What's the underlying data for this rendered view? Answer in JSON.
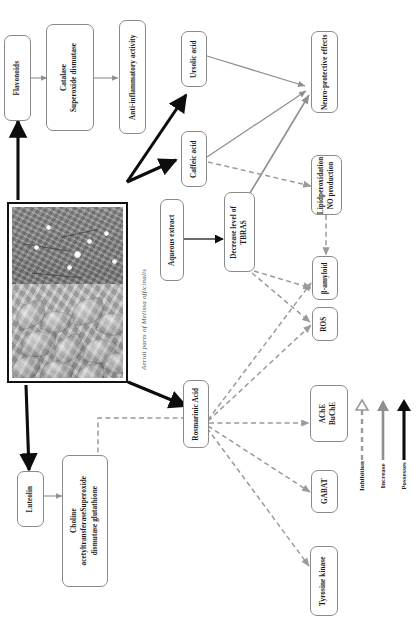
{
  "figure": {
    "caption": "Aerial parts of Melissa officinalis",
    "caption_species": "Melissa officinalis",
    "photo_alt": "Photograph of aerial parts of Melissa officinalis"
  },
  "nodes": {
    "flavonoids": "Flavonoids",
    "catalase_sod": "Catalase\nSuperoxide dismutase",
    "anti_inflammatory": "Anti-inflammatory activity",
    "ursolic_acid": "Ursolic acid",
    "caffeic_acid": "Caffeic acid",
    "neuroprotective": "Neuro-protective effects",
    "lipid_no": "Lipidperoxidation\nNO production",
    "aqueous_extract": "Aqueous extract",
    "tbras": "Decrease level of\nTBRAS",
    "beta_amyloid": "β-amyloid",
    "ros": "ROS",
    "ache_buche": "AChE\nBuChE",
    "gabat": "GABAT",
    "tyrosine_kinase": "Tyrosine   kinase",
    "rosmarinic_acid": "Rosmarinic Acid",
    "luteolin": "Luteolin",
    "choline": "Choline\nacetyltransferaseSuperoxide\ndismutase glutathione"
  },
  "legend": {
    "title": "",
    "items": [
      {
        "label": "Inhibition",
        "style": "dashed",
        "color": "#9a9a9a"
      },
      {
        "label": "Increase",
        "style": "solid",
        "color": "#8f8f8f"
      },
      {
        "label": "Possesses",
        "style": "solid",
        "color": "#0d0d0d"
      }
    ]
  },
  "colors": {
    "possesses": "#0d0d0d",
    "increase": "#8f8f8f",
    "inhibition": "#9a9a9a",
    "box_border": "#8a8a8a",
    "photo_border": "#111111",
    "text": "#1a1a1a",
    "caption_text": "#4f4f4f",
    "background": "#ffffff"
  },
  "edges": [
    {
      "from": "photo",
      "to": "flavonoids",
      "type": "possesses"
    },
    {
      "from": "photo",
      "to": "ursolic_acid",
      "type": "possesses"
    },
    {
      "from": "photo",
      "to": "caffeic_acid",
      "type": "possesses"
    },
    {
      "from": "photo",
      "to": "rosmarinic_acid",
      "type": "possesses"
    },
    {
      "from": "photo",
      "to": "luteolin",
      "type": "possesses"
    },
    {
      "from": "flavonoids",
      "to": "catalase_sod",
      "type": "increase"
    },
    {
      "from": "catalase_sod",
      "to": "anti_inflammatory",
      "type": "increase"
    },
    {
      "from": "ursolic_acid",
      "to": "neuroprotective",
      "type": "increase"
    },
    {
      "from": "caffeic_acid",
      "to": "neuroprotective",
      "type": "increase"
    },
    {
      "from": "tbras",
      "to": "neuroprotective",
      "type": "increase"
    },
    {
      "from": "caffeic_acid",
      "to": "lipid_no",
      "type": "inhibition"
    },
    {
      "from": "lipid_no",
      "to": "beta_amyloid",
      "type": "inhibition"
    },
    {
      "from": "aqueous_extract",
      "to": "tbras",
      "type": "possesses"
    },
    {
      "from": "tbras",
      "to": "ros",
      "type": "inhibition"
    },
    {
      "from": "tbras",
      "to": "beta_amyloid",
      "type": "inhibition"
    },
    {
      "from": "rosmarinic_acid",
      "to": "beta_amyloid",
      "type": "inhibition"
    },
    {
      "from": "rosmarinic_acid",
      "to": "ros",
      "type": "inhibition"
    },
    {
      "from": "rosmarinic_acid",
      "to": "ache_buche",
      "type": "inhibition"
    },
    {
      "from": "rosmarinic_acid",
      "to": "gabat",
      "type": "inhibition"
    },
    {
      "from": "rosmarinic_acid",
      "to": "tyrosine_kinase",
      "type": "inhibition"
    },
    {
      "from": "rosmarinic_acid",
      "to": "choline",
      "type": "inhibition"
    },
    {
      "from": "luteolin",
      "to": "choline",
      "type": "increase"
    }
  ]
}
